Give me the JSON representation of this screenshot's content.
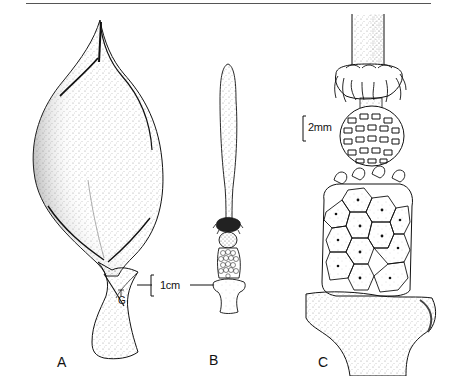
{
  "figure": {
    "panels": [
      {
        "id": "A",
        "label": "A",
        "description": "Spathe enclosing inflorescence, stippled, with annotation marks T and G near base"
      },
      {
        "id": "B",
        "label": "B",
        "description": "Spadix with elongated appendix, staminodes, male and female zones"
      },
      {
        "id": "C",
        "label": "C",
        "description": "Enlarged detail of spadix fertile zones"
      }
    ],
    "scale_bars": [
      {
        "panel": "A/B",
        "text": "1cm"
      },
      {
        "panel": "C",
        "text": "2mm"
      }
    ],
    "annotations": {
      "t_mark": "T",
      "g_mark": "G"
    },
    "colors": {
      "ink": "#111111",
      "stipple": "#9a9a9a",
      "background": "#ffffff",
      "rule": "#555555"
    }
  }
}
